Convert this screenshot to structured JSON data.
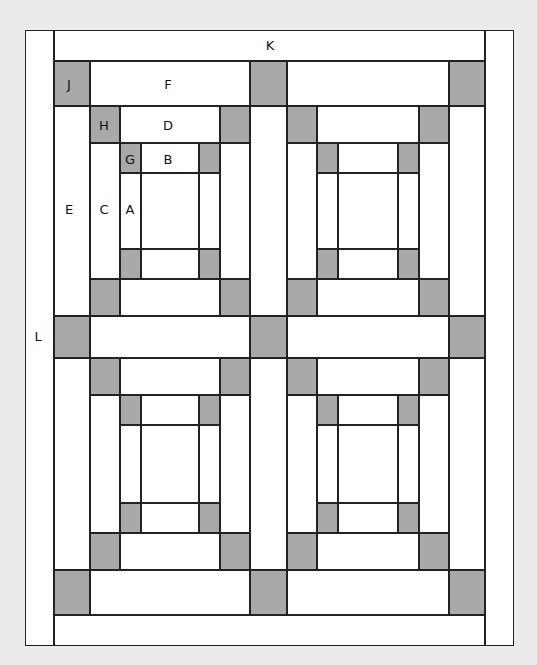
{
  "diagram": {
    "colors": {
      "background": "#ebebeb",
      "fabric_light": "#ffffff",
      "fabric_dark": "#a9a9a9",
      "seam": "#222222"
    },
    "labels": {
      "K": "K",
      "L": "L",
      "J": "J",
      "F": "F",
      "H": "H",
      "D": "D",
      "G": "G",
      "B": "B",
      "E": "E",
      "C": "C",
      "A": "A"
    },
    "blocks": 4,
    "layout": "2x2 log-cabin style blocks with sashing (F/E), cornerstones (J), border K (top/bottom) and L (left/right)"
  }
}
